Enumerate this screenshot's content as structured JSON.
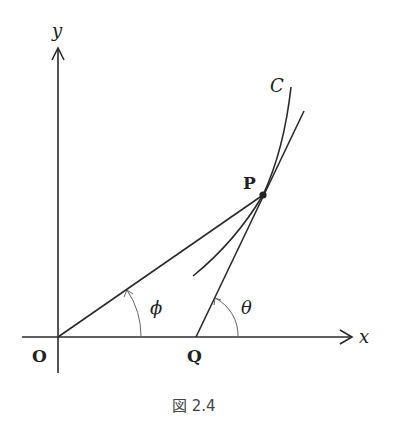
{
  "diagram": {
    "axes": {
      "x_label": "x",
      "y_label": "y"
    },
    "points": {
      "origin": "O",
      "P": "P",
      "Q": "Q"
    },
    "curve_label": "C",
    "angles": {
      "phi": "ϕ",
      "theta": "θ"
    },
    "caption": "図 2.4",
    "colors": {
      "line": "#2b2b2b",
      "background": "#ffffff"
    }
  }
}
